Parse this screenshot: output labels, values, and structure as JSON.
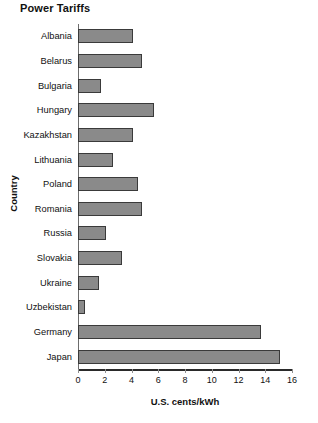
{
  "chart_data": {
    "type": "bar",
    "orientation": "horizontal",
    "title": "Power Tariffs",
    "xlabel": "U.S. cents/kWh",
    "ylabel": "Country",
    "categories": [
      "Albania",
      "Belarus",
      "Bulgaria",
      "Hungary",
      "Kazakhstan",
      "Lithuania",
      "Poland",
      "Romania",
      "Russia",
      "Slovakia",
      "Ukraine",
      "Uzbekistan",
      "Germany",
      "Japan"
    ],
    "values": [
      4.1,
      4.8,
      1.7,
      5.7,
      4.1,
      2.6,
      4.5,
      4.8,
      2.1,
      3.3,
      1.6,
      0.5,
      13.7,
      15.1
    ],
    "xlim": [
      0,
      16
    ],
    "xticks": [
      0,
      2,
      4,
      6,
      8,
      10,
      12,
      14,
      16
    ],
    "xtick_labels": [
      "0",
      "2",
      "4",
      "6",
      "8",
      "10",
      "12",
      "14",
      "16"
    ],
    "grid": false,
    "legend": null,
    "bar_color": "#8a8a8a",
    "bar_edge_color": "#3a3a3a"
  }
}
